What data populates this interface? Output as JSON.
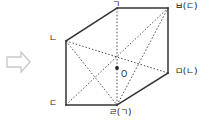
{
  "figure": {
    "stroke_color": "#333333",
    "hidden_stroke_color": "#555555",
    "background": "#ffffff",
    "arrow": {
      "name": "right-arrow",
      "glyph": "⇨",
      "color": "#cccccc"
    },
    "center": {
      "label": "O",
      "x": 117,
      "y": 68
    },
    "vertices": [
      {
        "id": "top-back",
        "label": "ㄱ",
        "x": 117,
        "y": 8,
        "label_x": 112,
        "label_y": 1
      },
      {
        "id": "top-right",
        "label": "ㅂ(ㄷ)",
        "x": 168,
        "y": 8,
        "label_x": 175,
        "label_y": 3
      },
      {
        "id": "left-back",
        "label": "ㄴ",
        "x": 66,
        "y": 41,
        "label_x": 50,
        "label_y": 35
      },
      {
        "id": "right-front",
        "label": "ㅁ(ㄴ)",
        "x": 168,
        "y": 73,
        "label_x": 175,
        "label_y": 68
      },
      {
        "id": "bottom-left",
        "label": "ㄷ",
        "x": 66,
        "y": 105,
        "label_x": 50,
        "label_y": 100
      },
      {
        "id": "bottom-mid",
        "label": "ㄹ(ㄱ)",
        "x": 117,
        "y": 105,
        "label_x": 110,
        "label_y": 108
      }
    ],
    "solid_edges": [
      {
        "from": "left-back",
        "to": "top-back"
      },
      {
        "from": "top-back",
        "to": "top-right"
      },
      {
        "from": "top-right",
        "to": "right-front"
      },
      {
        "from": "right-front",
        "to": "bottom-mid"
      },
      {
        "from": "bottom-mid",
        "to": "bottom-left"
      },
      {
        "from": "bottom-left",
        "to": "left-back"
      }
    ],
    "hidden_edges": [
      {
        "from": "left-back",
        "to": "bottom-mid"
      },
      {
        "from": "bottom-mid",
        "to": "top-right"
      },
      {
        "from": "top-back",
        "to": "bottom-mid"
      }
    ],
    "diagonals": [
      {
        "from": "left-back",
        "to": "right-front"
      },
      {
        "from": "bottom-left",
        "to": "top-right"
      },
      {
        "from": "top-back",
        "to": "bottom-mid"
      }
    ]
  }
}
